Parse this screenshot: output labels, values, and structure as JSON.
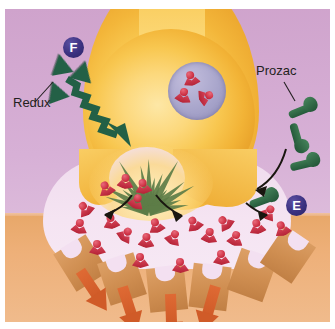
{
  "figure": {
    "kind": "serotonin-synapse-illustration",
    "background_color": "#d3a8cf",
    "border_color": "#ffffff"
  },
  "labels": {
    "redux": "Redux",
    "prozac": "Prozac"
  },
  "badges": [
    {
      "id": "badge-f",
      "letter": "F",
      "x": 58,
      "y": 28,
      "color": "#2b2466"
    },
    {
      "id": "badge-e",
      "letter": "E",
      "x": 281,
      "y": 186,
      "color": "#2b2466"
    }
  ],
  "regions": {
    "presynaptic_terminal": {
      "name": "presynaptic-terminal",
      "color": "#f8c750"
    },
    "synaptic_cleft": {
      "name": "synaptic-cleft",
      "color": "#f3e0f1"
    },
    "postsynaptic_cell": {
      "name": "postsynaptic-cell",
      "color": "#eeb079"
    },
    "vesicle": {
      "name": "synaptic-vesicle",
      "color": "#a8a5cb"
    },
    "starburst": {
      "name": "release-starburst",
      "color": "#5d7d48"
    }
  },
  "molecules": {
    "serotonin_color": "#cf3346",
    "redux_color": "#236046",
    "prozac_color": "#24593a",
    "receptor_color": "#cf8e51",
    "signal_arrow_color": "#d05b28"
  },
  "serotonin_in_vesicle": [
    {
      "x": 178,
      "y": 62,
      "rot": -12
    },
    {
      "x": 170,
      "y": 79,
      "rot": 14
    },
    {
      "x": 192,
      "y": 80,
      "rot": 70
    }
  ],
  "serotonin_in_cleft": [
    {
      "x": 93,
      "y": 172,
      "rot": -20
    },
    {
      "x": 112,
      "y": 165,
      "rot": 8
    },
    {
      "x": 130,
      "y": 170,
      "rot": -6
    },
    {
      "x": 123,
      "y": 185,
      "rot": 24
    },
    {
      "x": 72,
      "y": 192,
      "rot": -34
    },
    {
      "x": 66,
      "y": 210,
      "rot": 12
    },
    {
      "x": 98,
      "y": 205,
      "rot": -8
    },
    {
      "x": 112,
      "y": 218,
      "rot": 40
    },
    {
      "x": 143,
      "y": 209,
      "rot": -16
    },
    {
      "x": 133,
      "y": 224,
      "rot": 6
    },
    {
      "x": 160,
      "y": 221,
      "rot": 28
    },
    {
      "x": 181,
      "y": 207,
      "rot": -24
    },
    {
      "x": 196,
      "y": 219,
      "rot": 10
    },
    {
      "x": 212,
      "y": 206,
      "rot": -40
    },
    {
      "x": 222,
      "y": 222,
      "rot": 16
    },
    {
      "x": 244,
      "y": 210,
      "rot": -10
    },
    {
      "x": 255,
      "y": 196,
      "rot": 34
    },
    {
      "x": 269,
      "y": 212,
      "rot": -18
    }
  ],
  "serotonin_bound": [
    {
      "x": 84,
      "y": 231,
      "rot": 0
    },
    {
      "x": 127,
      "y": 244,
      "rot": 0
    },
    {
      "x": 167,
      "y": 249,
      "rot": 0
    },
    {
      "x": 208,
      "y": 241,
      "rot": 0
    }
  ],
  "receptors": [
    {
      "x": 57,
      "y": 232,
      "rot": -32,
      "occupied": false
    },
    {
      "x": 98,
      "y": 248,
      "rot": -18,
      "occupied": true
    },
    {
      "x": 143,
      "y": 258,
      "rot": -6,
      "occupied": true
    },
    {
      "x": 186,
      "y": 256,
      "rot": 7,
      "occupied": true
    },
    {
      "x": 228,
      "y": 244,
      "rot": 20,
      "occupied": true
    },
    {
      "x": 264,
      "y": 224,
      "rot": 34,
      "occupied": false
    }
  ],
  "signal_arrows": [
    {
      "x": 75,
      "y": 262,
      "rot": -34
    },
    {
      "x": 117,
      "y": 278,
      "rot": -18
    },
    {
      "x": 165,
      "y": 285,
      "rot": -2
    },
    {
      "x": 210,
      "y": 277,
      "rot": 16
    }
  ],
  "redux_triangles": [
    {
      "x": 45,
      "y": 45,
      "rot": 170
    },
    {
      "x": 67,
      "y": 52,
      "rot": 195
    },
    {
      "x": 40,
      "y": 72,
      "rot": 160
    }
  ],
  "prozac_molecules": [
    {
      "x": 283,
      "y": 91,
      "rot": -22
    },
    {
      "x": 277,
      "y": 119,
      "rot": 74
    },
    {
      "x": 285,
      "y": 145,
      "rot": -14
    },
    {
      "x": 244,
      "y": 181,
      "rot": -20
    }
  ]
}
